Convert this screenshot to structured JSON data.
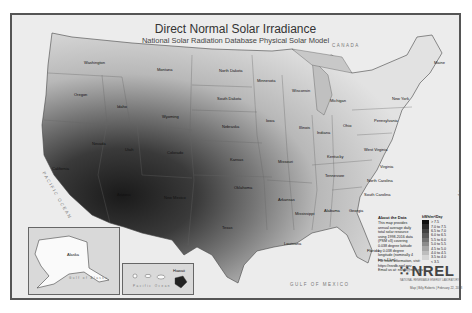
{
  "title": "Direct Normal Solar Irradiance",
  "subtitle": "National Solar Radiation Database Physical Solar Model",
  "states": [
    {
      "name": "Washington",
      "x": 72,
      "y": 45
    },
    {
      "name": "Oregon",
      "x": 62,
      "y": 77
    },
    {
      "name": "Idaho",
      "x": 105,
      "y": 89
    },
    {
      "name": "Montana",
      "x": 145,
      "y": 52
    },
    {
      "name": "Wyoming",
      "x": 150,
      "y": 99
    },
    {
      "name": "Nevada",
      "x": 80,
      "y": 126
    },
    {
      "name": "California",
      "x": 40,
      "y": 151
    },
    {
      "name": "Utah",
      "x": 113,
      "y": 132
    },
    {
      "name": "Colorado",
      "x": 155,
      "y": 135
    },
    {
      "name": "Arizona",
      "x": 105,
      "y": 177
    },
    {
      "name": "New Mexico",
      "x": 152,
      "y": 180
    },
    {
      "name": "North Dakota",
      "x": 207,
      "y": 53
    },
    {
      "name": "South Dakota",
      "x": 205,
      "y": 81
    },
    {
      "name": "Nebraska",
      "x": 210,
      "y": 109
    },
    {
      "name": "Kansas",
      "x": 218,
      "y": 142
    },
    {
      "name": "Oklahoma",
      "x": 222,
      "y": 170
    },
    {
      "name": "Texas",
      "x": 210,
      "y": 210
    },
    {
      "name": "Minnesota",
      "x": 245,
      "y": 63
    },
    {
      "name": "Iowa",
      "x": 254,
      "y": 103
    },
    {
      "name": "Missouri",
      "x": 266,
      "y": 144
    },
    {
      "name": "Arkansas",
      "x": 266,
      "y": 182
    },
    {
      "name": "Louisiana",
      "x": 272,
      "y": 226
    },
    {
      "name": "Wisconsin",
      "x": 280,
      "y": 73
    },
    {
      "name": "Illinois",
      "x": 287,
      "y": 110
    },
    {
      "name": "Michigan",
      "x": 318,
      "y": 83
    },
    {
      "name": "Indiana",
      "x": 305,
      "y": 115
    },
    {
      "name": "Ohio",
      "x": 331,
      "y": 108
    },
    {
      "name": "Kentucky",
      "x": 315,
      "y": 139
    },
    {
      "name": "Tennessee",
      "x": 313,
      "y": 158
    },
    {
      "name": "Mississippi",
      "x": 283,
      "y": 196
    },
    {
      "name": "Alabama",
      "x": 312,
      "y": 193
    },
    {
      "name": "Georgia",
      "x": 337,
      "y": 193
    },
    {
      "name": "Florida",
      "x": 355,
      "y": 233
    },
    {
      "name": "South Carolina",
      "x": 352,
      "y": 177
    },
    {
      "name": "North Carolina",
      "x": 355,
      "y": 163
    },
    {
      "name": "Virginia",
      "x": 368,
      "y": 149
    },
    {
      "name": "West Virginia",
      "x": 352,
      "y": 132
    },
    {
      "name": "Pennsylvania",
      "x": 362,
      "y": 103
    },
    {
      "name": "New York",
      "x": 380,
      "y": 81
    },
    {
      "name": "Maine",
      "x": 422,
      "y": 45
    }
  ],
  "oceans": [
    {
      "name": "PACIFIC OCEAN",
      "x": 18,
      "y": 178
    },
    {
      "name": "ATLANTIC OCEAN",
      "x": 425,
      "y": 150
    },
    {
      "name": "GULF OF MEXICO",
      "x": 278,
      "y": 267
    },
    {
      "name": "CANADA",
      "x": 320,
      "y": 28
    }
  ],
  "insets": {
    "alaska": {
      "label": "Alaska",
      "sublabel": "Gulf of Alaska"
    },
    "hawaii": {
      "label": "Hawaii",
      "sublabel": "Pacific Ocean"
    }
  },
  "legend": {
    "about_title": "About the Data",
    "about_text": "This map provides annual average daily total solar resource using 1998-2016 data (PSM v3) covering 0.038 degree latitude by 0.038 degree longitude (nominally 4 km x 4 km).",
    "more_info": "For more information, visit: https://nsrdb.nrel.gov",
    "email": "Email us at: nsrdb@nrel.gov",
    "scale_title": "kWh/m²/Day",
    "items": [
      {
        "label": "> 7.5",
        "color": "#111111"
      },
      {
        "label": "7.0 to 7.5",
        "color": "#2a2a2a"
      },
      {
        "label": "6.5 to 7.0",
        "color": "#424242"
      },
      {
        "label": "6.0 to 6.5",
        "color": "#5a5a5a"
      },
      {
        "label": "5.5 to 6.0",
        "color": "#727272"
      },
      {
        "label": "5.0 to 5.5",
        "color": "#8c8c8c"
      },
      {
        "label": "4.5 to 5.0",
        "color": "#a6a6a6"
      },
      {
        "label": "4.0 to 4.5",
        "color": "#bdbdbd"
      },
      {
        "label": "3.5 to 4.0",
        "color": "#d4d4d4"
      },
      {
        "label": "< 3.5",
        "color": "#ececec"
      }
    ]
  },
  "logo": {
    "text": "NREL",
    "subtitle": "NATIONAL RENEWABLE ENERGY LABORATORY",
    "credit": "Map | Billy Roberts | February 22, 2018"
  }
}
